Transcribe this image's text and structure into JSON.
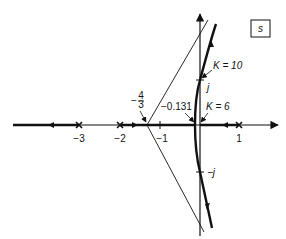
{
  "diagram": {
    "type": "root-locus",
    "plane_label": "s",
    "colors": {
      "ink": "#111111",
      "background": "#ffffff"
    },
    "real_axis": {
      "ticks": [
        {
          "value": -3,
          "label": "−3"
        },
        {
          "value": -2,
          "label": "−2"
        },
        {
          "value": -1,
          "label": "−1"
        },
        {
          "value": 1,
          "label": "1"
        }
      ]
    },
    "imag_axis": {
      "ticks": [
        {
          "value": 1,
          "label": "j"
        },
        {
          "value": -1,
          "label": "−j"
        }
      ]
    },
    "poles": [
      -3,
      -2,
      1
    ],
    "annotations": {
      "centroid_sign": "−",
      "centroid_num": "4",
      "centroid_den": "3",
      "breakaway": "−0.131",
      "k_breakaway": "K = 6",
      "k_crossing": "K = 10"
    }
  }
}
